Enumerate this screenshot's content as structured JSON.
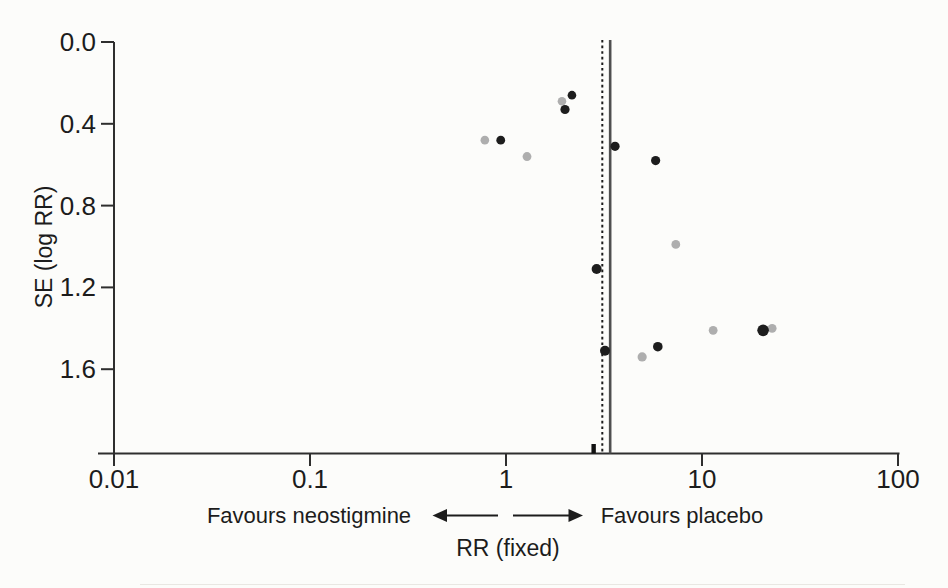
{
  "figure": {
    "background": "#fcfcfa",
    "axis_color": "#2e2e2e",
    "text_color": "#1c1c1c"
  },
  "chart_data": {
    "type": "scatter",
    "chart_kind": "funnel-plot",
    "title": "",
    "xlabel": "RR (fixed)",
    "ylabel": "SE (log RR)",
    "x_scale": "log",
    "xlim": [
      0.01,
      100
    ],
    "ylim_top_to_bottom": [
      0.0,
      2.0
    ],
    "x_ticks": [
      "0.01",
      "0.1",
      "1",
      "10",
      "100"
    ],
    "y_ticks": [
      "0.0",
      "0.4",
      "0.8",
      "1.2",
      "1.6"
    ],
    "grid": false,
    "legend": "none",
    "direction_labels": {
      "left": "Favours neostigmine",
      "right": "Favours placebo"
    },
    "reference_lines": [
      {
        "style": "dashed",
        "rr": 3.1,
        "color": "#1b1b1b"
      },
      {
        "style": "solid",
        "rr": 3.4,
        "color": "#4f4f4f"
      }
    ],
    "pooled_marker_rr": 2.8,
    "series": [
      {
        "name": "grey",
        "color": "#aeaeae",
        "points": [
          {
            "rr": 1.93,
            "se": 0.29,
            "r": 4.3
          },
          {
            "rr": 0.78,
            "se": 0.48,
            "r": 4.3
          },
          {
            "rr": 1.28,
            "se": 0.56,
            "r": 4.4
          },
          {
            "rr": 7.35,
            "se": 0.99,
            "r": 4.4
          },
          {
            "rr": 11.4,
            "se": 1.41,
            "r": 4.4
          },
          {
            "rr": 22.8,
            "se": 1.4,
            "r": 4.4
          },
          {
            "rr": 4.95,
            "se": 1.54,
            "r": 4.6
          }
        ]
      },
      {
        "name": "black",
        "color": "#1d1d1d",
        "points": [
          {
            "rr": 2.17,
            "se": 0.26,
            "r": 4.3
          },
          {
            "rr": 2.0,
            "se": 0.33,
            "r": 4.6
          },
          {
            "rr": 0.94,
            "se": 0.48,
            "r": 4.4
          },
          {
            "rr": 3.6,
            "se": 0.51,
            "r": 4.6
          },
          {
            "rr": 5.8,
            "se": 0.58,
            "r": 4.6
          },
          {
            "rr": 2.9,
            "se": 1.11,
            "r": 5.0
          },
          {
            "rr": 20.5,
            "se": 1.41,
            "r": 5.8
          },
          {
            "rr": 3.2,
            "se": 1.51,
            "r": 5.0
          },
          {
            "rr": 5.95,
            "se": 1.49,
            "r": 4.8
          }
        ]
      }
    ]
  }
}
